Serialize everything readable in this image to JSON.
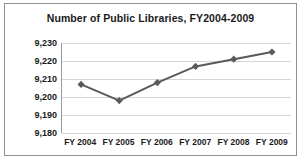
{
  "chart_data": {
    "type": "line",
    "title": "Number of Public Libraries, FY2004-2009",
    "xlabel": "",
    "ylabel": "",
    "categories": [
      "FY 2004",
      "FY 2005",
      "FY 2006",
      "FY 2007",
      "FY 2008",
      "FY 2009"
    ],
    "values": [
      9207,
      9198,
      9208,
      9217,
      9221,
      9225
    ],
    "ylim": [
      9180,
      9230
    ],
    "yticks": [
      "9,180",
      "9,190",
      "9,200",
      "9,210",
      "9,220",
      "9,230"
    ],
    "ytick_values": [
      9180,
      9190,
      9200,
      9210,
      9220,
      9230
    ],
    "grid": true,
    "legend": "none",
    "series_color": "#5a5a5a",
    "marker": "diamond",
    "gridline_color": "#d6d6d6",
    "text_color": "#1a1a1a",
    "border_color": "#8f8f8f",
    "background": "#ffffff"
  }
}
